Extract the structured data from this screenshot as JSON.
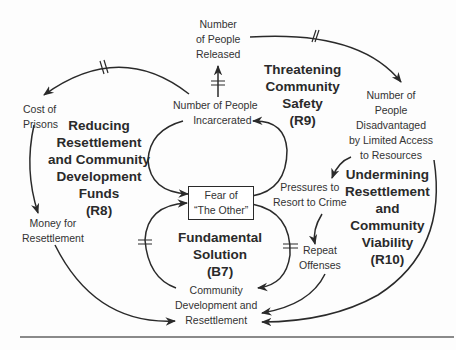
{
  "diagram": {
    "type": "causal-loop-diagram",
    "variables": {
      "released": [
        "Number",
        "of People",
        "Released"
      ],
      "incarcerated": [
        "Number of People",
        "Incarcerated"
      ],
      "cost": [
        "Cost of",
        "Prisons"
      ],
      "money": [
        "Money for",
        "Resettlement"
      ],
      "fear": [
        "Fear of",
        "“The Other”"
      ],
      "disadvantaged": [
        "Number of",
        "People",
        "Disadvantaged",
        "by Limited Access",
        "to Resources"
      ],
      "pressures": [
        "Pressures to",
        "Resort to Crime"
      ],
      "repeat": [
        "Repeat",
        "Offenses"
      ],
      "community": [
        "Community",
        "Development and",
        "Resettlement"
      ]
    },
    "loops": {
      "r9": [
        "Threatening",
        "Community",
        "Safety",
        "(R9)"
      ],
      "r8": [
        "Reducing",
        "Resettlement",
        "and Community",
        "Development",
        "Funds",
        "(R8)"
      ],
      "b7": [
        "Fundamental",
        "Solution",
        "(B7)"
      ],
      "r10": [
        "Undermining",
        "Resettlement",
        "and",
        "Community",
        "Viability",
        "(R10)"
      ]
    },
    "links": [
      {
        "from": "Number of People Incarcerated",
        "to": "Number of People Released",
        "delay": true
      },
      {
        "from": "Number of People Released",
        "to": "Number of People Disadvantaged by Limited Access to Resources",
        "delay": true
      },
      {
        "from": "Number of People Incarcerated",
        "to": "Cost of Prisons",
        "delay": true
      },
      {
        "from": "Cost of Prisons",
        "to": "Money for Resettlement",
        "delay": false
      },
      {
        "from": "Money for Resettlement",
        "to": "Community Development and Resettlement",
        "delay": false
      },
      {
        "from": "Number of People Incarcerated",
        "to": "Fear of The Other",
        "delay": false
      },
      {
        "from": "Fear of The Other",
        "to": "Number of People Incarcerated",
        "delay": false
      },
      {
        "from": "Community Development and Resettlement",
        "to": "Fear of The Other",
        "delay": true
      },
      {
        "from": "Fear of The Other",
        "to": "Community Development and Resettlement",
        "delay": true
      },
      {
        "from": "Number of People Disadvantaged by Limited Access to Resources",
        "to": "Pressures to Resort to Crime",
        "delay": false
      },
      {
        "from": "Pressures to Resort to Crime",
        "to": "Repeat Offenses",
        "delay": false
      },
      {
        "from": "Repeat Offenses",
        "to": "Community Development and Resettlement",
        "delay": false
      },
      {
        "from": "Number of People Disadvantaged by Limited Access to Resources",
        "to": "Community Development and Resettlement",
        "delay": false
      }
    ],
    "colors": {
      "ink": "#2a2a2a",
      "rule": "#8a8a8a",
      "background": "#fdfdfd"
    }
  }
}
